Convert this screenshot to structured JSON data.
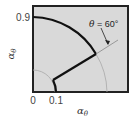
{
  "figure": {
    "type": "diagram",
    "plot_box": {
      "fill": "#d9d9d9",
      "border": "#222222"
    },
    "x_axis": {
      "label": "α",
      "label_subscript": "θ",
      "ticks": [
        "0",
        "0.1"
      ]
    },
    "y_axis": {
      "label": "α",
      "label_subscript": "θ",
      "ticks": [
        "0.9"
      ]
    },
    "annotation": {
      "symbol": "θ",
      "text": " = 60°"
    },
    "curves": [
      {
        "name": "outer-arc",
        "description": "Thick arc of radius 0.9 from vertical axis down to θ=60°"
      },
      {
        "name": "radial-segment",
        "description": "Straight line from arc end inward to inner radius"
      },
      {
        "name": "inner-arc",
        "description": "Short arc at radius 0.1 down to x-axis"
      },
      {
        "name": "guide-circle-outer",
        "description": "Thin gray continuation of outer circle"
      },
      {
        "name": "guide-circle-inner",
        "description": "Thin gray circle at radius ~0.25"
      }
    ]
  }
}
